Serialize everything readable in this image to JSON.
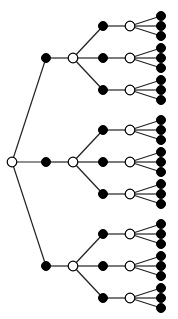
{
  "diagram": {
    "type": "tree",
    "orientation": "left-to-right",
    "colors": {
      "background": "#ffffff",
      "edge": "#222222",
      "filled": "#000000",
      "open_fill": "#ffffff"
    },
    "node_radius": {
      "filled": 4.5,
      "open": 4.8,
      "leaf": 4.5
    },
    "root": {
      "x": 12,
      "y": 162,
      "style": "open"
    },
    "level1_x": 46,
    "level2_x": 73,
    "level3_x": 103,
    "level4_x": 130,
    "leaf_x": 161,
    "branch_ys": [
      58,
      162,
      266
    ],
    "sub_offsets": [
      -32,
      0,
      32
    ],
    "leaf_offsets": [
      -10,
      0,
      10
    ],
    "levels": [
      {
        "depth": 0,
        "style": "open",
        "count": 1
      },
      {
        "depth": 1,
        "style": "filled",
        "count": 3
      },
      {
        "depth": 2,
        "style": "open",
        "count": 3
      },
      {
        "depth": 3,
        "style": "filled",
        "count": 9
      },
      {
        "depth": 4,
        "style": "open",
        "count": 9
      },
      {
        "depth": 5,
        "style": "filled",
        "count": 27
      }
    ]
  }
}
